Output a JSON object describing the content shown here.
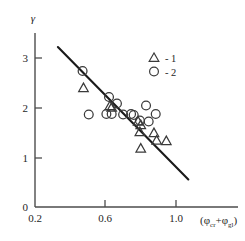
{
  "chart_data": {
    "type": "scatter",
    "title": "",
    "xlabel": "(φcr+φgl)",
    "ylabel": "γ",
    "xlim": [
      0.2,
      1.08
    ],
    "ylim": [
      0.0,
      3.45
    ],
    "xticks": [
      0.2,
      0.6,
      1.0
    ],
    "xtick_labels": [
      "0.2",
      "0.6",
      "1.0"
    ],
    "yticks": [
      0,
      1,
      2,
      3
    ],
    "ytick_labels": [
      "0",
      "1",
      "2",
      "3"
    ],
    "grid": false,
    "legend_position": "upper-right",
    "series": [
      {
        "name": "1",
        "marker": "triangle",
        "legend_label": "- 1",
        "points": [
          {
            "x": 0.475,
            "y": 2.38
          },
          {
            "x": 0.625,
            "y": 2.02
          },
          {
            "x": 0.635,
            "y": 1.99
          },
          {
            "x": 0.785,
            "y": 1.71
          },
          {
            "x": 0.8,
            "y": 1.64
          },
          {
            "x": 0.795,
            "y": 1.5
          },
          {
            "x": 0.8,
            "y": 1.17
          },
          {
            "x": 0.875,
            "y": 1.48
          },
          {
            "x": 0.89,
            "y": 1.33
          },
          {
            "x": 0.945,
            "y": 1.32
          }
        ]
      },
      {
        "name": "2",
        "marker": "circle",
        "legend_label": "- 2",
        "points": [
          {
            "x": 0.47,
            "y": 2.72
          },
          {
            "x": 0.505,
            "y": 1.85
          },
          {
            "x": 0.605,
            "y": 1.86
          },
          {
            "x": 0.62,
            "y": 2.2
          },
          {
            "x": 0.665,
            "y": 2.07
          },
          {
            "x": 0.745,
            "y": 1.86
          },
          {
            "x": 0.76,
            "y": 1.84
          },
          {
            "x": 0.795,
            "y": 1.73
          },
          {
            "x": 0.83,
            "y": 2.03
          },
          {
            "x": 0.845,
            "y": 1.71
          },
          {
            "x": 0.885,
            "y": 1.86
          },
          {
            "x": 0.7,
            "y": 1.85
          },
          {
            "x": 0.635,
            "y": 1.86
          }
        ]
      }
    ],
    "trend_line": {
      "x0": 0.33,
      "y0": 3.2,
      "x1": 1.07,
      "y1": 0.55,
      "color": "#1a1a1a"
    },
    "colors": {
      "axis": "#4d4d4d",
      "marker": "#3a3a3a",
      "line": "#1a1a1a",
      "text": "#262626",
      "background": "#ffffff"
    }
  },
  "legend": {
    "entries": [
      {
        "symbol": "triangle-marker",
        "label": "- 1"
      },
      {
        "symbol": "circle-marker",
        "label": "- 2"
      }
    ]
  },
  "axis_labels": {
    "y": "γ",
    "x_open": "(",
    "x_phi1": "φ",
    "x_sub1": "cr",
    "x_plus": "+",
    "x_phi2": "φ",
    "x_sub2": "gl",
    "x_close": ")"
  }
}
